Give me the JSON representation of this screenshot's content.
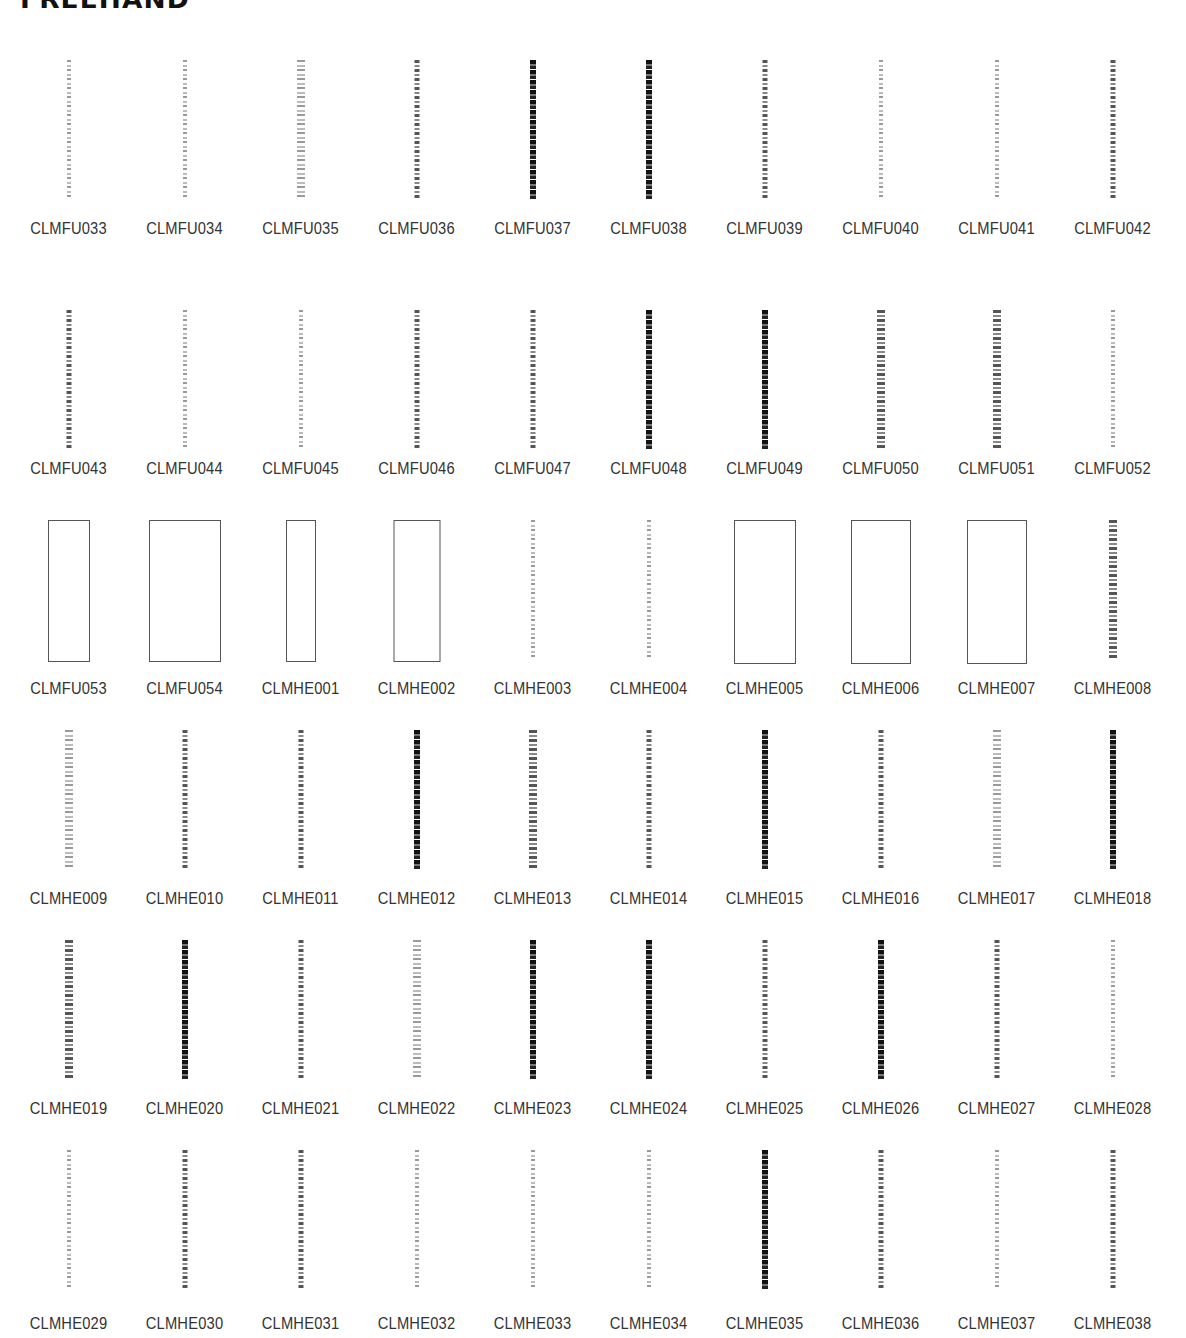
{
  "page": {
    "title": "FREEHAND"
  },
  "rows": [
    {
      "items": [
        {
          "code": "CLMFU033",
          "style": "light"
        },
        {
          "code": "CLMFU034",
          "style": "light"
        },
        {
          "code": "CLMFU035",
          "style": "light wide"
        },
        {
          "code": "CLMFU036",
          "style": ""
        },
        {
          "code": "CLMFU037",
          "style": "dark"
        },
        {
          "code": "CLMFU038",
          "style": "dark"
        },
        {
          "code": "CLMFU039",
          "style": ""
        },
        {
          "code": "CLMFU040",
          "style": "light"
        },
        {
          "code": "CLMFU041",
          "style": "light"
        },
        {
          "code": "CLMFU042",
          "style": ""
        }
      ]
    },
    {
      "items": [
        {
          "code": "CLMFU043",
          "style": ""
        },
        {
          "code": "CLMFU044",
          "style": "light"
        },
        {
          "code": "CLMFU045",
          "style": "light"
        },
        {
          "code": "CLMFU046",
          "style": ""
        },
        {
          "code": "CLMFU047",
          "style": ""
        },
        {
          "code": "CLMFU048",
          "style": "dark"
        },
        {
          "code": "CLMFU049",
          "style": "dark"
        },
        {
          "code": "CLMFU050",
          "style": "wide"
        },
        {
          "code": "CLMFU051",
          "style": "wide"
        },
        {
          "code": "CLMFU052",
          "style": "light"
        }
      ]
    },
    {
      "items": [
        {
          "code": "CLMFU053",
          "style": "pic"
        },
        {
          "code": "CLMFU054",
          "style": "pic"
        },
        {
          "code": "CLMHE001",
          "style": "pic"
        },
        {
          "code": "CLMHE002",
          "style": "pic"
        },
        {
          "code": "CLMHE003",
          "style": "light"
        },
        {
          "code": "CLMHE004",
          "style": "light"
        },
        {
          "code": "CLMHE005",
          "style": "pic"
        },
        {
          "code": "CLMHE006",
          "style": "pic"
        },
        {
          "code": "CLMHE007",
          "style": "pic"
        },
        {
          "code": "CLMHE008",
          "style": "wide"
        }
      ]
    },
    {
      "items": [
        {
          "code": "CLMHE009",
          "style": "light wide"
        },
        {
          "code": "CLMHE010",
          "style": ""
        },
        {
          "code": "CLMHE011",
          "style": ""
        },
        {
          "code": "CLMHE012",
          "style": "dark"
        },
        {
          "code": "CLMHE013",
          "style": "wide"
        },
        {
          "code": "CLMHE014",
          "style": ""
        },
        {
          "code": "CLMHE015",
          "style": "dark"
        },
        {
          "code": "CLMHE016",
          "style": ""
        },
        {
          "code": "CLMHE017",
          "style": "light wide"
        },
        {
          "code": "CLMHE018",
          "style": "dark"
        }
      ]
    },
    {
      "items": [
        {
          "code": "CLMHE019",
          "style": "wide"
        },
        {
          "code": "CLMHE020",
          "style": "dark"
        },
        {
          "code": "CLMHE021",
          "style": ""
        },
        {
          "code": "CLMHE022",
          "style": "light wide"
        },
        {
          "code": "CLMHE023",
          "style": "dark"
        },
        {
          "code": "CLMHE024",
          "style": "dark"
        },
        {
          "code": "CLMHE025",
          "style": ""
        },
        {
          "code": "CLMHE026",
          "style": "dark"
        },
        {
          "code": "CLMHE027",
          "style": ""
        },
        {
          "code": "CLMHE028",
          "style": "light"
        }
      ]
    },
    {
      "items": [
        {
          "code": "CLMHE029",
          "style": "light"
        },
        {
          "code": "CLMHE030",
          "style": ""
        },
        {
          "code": "CLMHE031",
          "style": ""
        },
        {
          "code": "CLMHE032",
          "style": "light"
        },
        {
          "code": "CLMHE033",
          "style": "light"
        },
        {
          "code": "CLMHE034",
          "style": "light"
        },
        {
          "code": "CLMHE035",
          "style": "dark"
        },
        {
          "code": "CLMHE036",
          "style": ""
        },
        {
          "code": "CLMHE037",
          "style": "light"
        },
        {
          "code": "CLMHE038",
          "style": ""
        }
      ]
    }
  ]
}
